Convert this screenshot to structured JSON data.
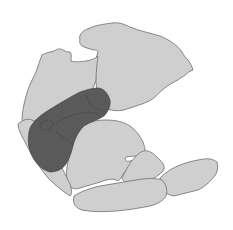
{
  "map": {
    "type": "paleogeographic-reconstruction",
    "labels": [],
    "colors": {
      "background": "#ffffff",
      "land": "#cfcfcf",
      "coastline": "#6f6f6f",
      "highlight_region": "#5a5a5a",
      "highlight_border": "#3f3f3f"
    },
    "regions": [
      {
        "id": "north-block",
        "role": "landmass"
      },
      {
        "id": "west-block",
        "role": "landmass"
      },
      {
        "id": "central-block",
        "role": "landmass"
      },
      {
        "id": "southeast-block",
        "role": "landmass"
      },
      {
        "id": "east-spur",
        "role": "landmass"
      },
      {
        "id": "south-block",
        "role": "landmass"
      },
      {
        "id": "shaded-zone",
        "role": "highlighted-area"
      }
    ]
  }
}
